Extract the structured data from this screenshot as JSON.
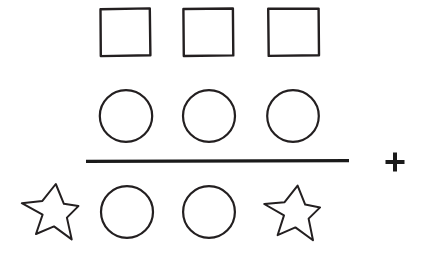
{
  "document": {
    "title": "Shape arithmetic puzzle",
    "background_color": "#ffffff",
    "ink_color": "#231f20",
    "width": 429,
    "height": 253
  },
  "diagram": {
    "type": "shape-arithmetic",
    "rows": [
      {
        "id": "row-squares",
        "label": "Top row",
        "shape": "square",
        "count": 3,
        "count_label": "3",
        "items": [
          {
            "shape": "square",
            "label": "square-1",
            "x": 100,
            "y": 8,
            "w": 50,
            "h": 48
          },
          {
            "shape": "square",
            "label": "square-2",
            "x": 183,
            "y": 8,
            "w": 50,
            "h": 48
          },
          {
            "shape": "square",
            "label": "square-3",
            "x": 268,
            "y": 8,
            "w": 51,
            "h": 48
          }
        ]
      },
      {
        "id": "row-circles",
        "label": "Second row",
        "shape": "circle",
        "count": 3,
        "count_label": "3",
        "items": [
          {
            "shape": "circle",
            "label": "circle-1",
            "cx": 126,
            "cy": 116,
            "r": 26
          },
          {
            "shape": "circle",
            "label": "circle-2",
            "cx": 209,
            "cy": 116,
            "r": 26
          },
          {
            "shape": "circle",
            "label": "circle-3",
            "cx": 293,
            "cy": 116,
            "r": 26
          }
        ]
      },
      {
        "id": "row-bottom",
        "label": "Bottom row",
        "shape": "mixed",
        "count": 4,
        "count_label": "4",
        "items": [
          {
            "shape": "star",
            "label": "star-left",
            "cx": 49,
            "cy": 212,
            "r": 30
          },
          {
            "shape": "circle",
            "label": "circle-4",
            "cx": 127,
            "cy": 212,
            "r": 26
          },
          {
            "shape": "circle",
            "label": "circle-5",
            "cx": 209,
            "cy": 212,
            "r": 26
          },
          {
            "shape": "star",
            "label": "star-right",
            "cx": 292,
            "cy": 212,
            "r": 30
          }
        ]
      }
    ],
    "sum_bar": {
      "label": "horizontal sum bar",
      "x1": 86,
      "x2": 349,
      "y": 161,
      "thickness": 3.4
    },
    "operator": {
      "symbol": "+",
      "name": "plus-sign",
      "cx": 395,
      "cy": 162,
      "size": 19,
      "thickness": 4
    }
  },
  "legend": {
    "shapes": [
      {
        "name": "square",
        "glyph": "□"
      },
      {
        "name": "circle",
        "glyph": "○"
      },
      {
        "name": "star",
        "glyph": "☆"
      },
      {
        "name": "plus",
        "glyph": "+"
      }
    ]
  }
}
